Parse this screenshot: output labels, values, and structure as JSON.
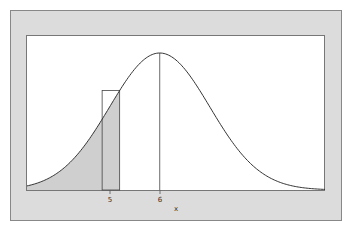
{
  "chart_data": {
    "type": "line",
    "title": "",
    "xlabel": "x",
    "ylabel": "",
    "distribution": "normal",
    "mean": 6,
    "sd": 1,
    "x_ticks": [
      {
        "value": 5,
        "label": "5"
      },
      {
        "value": 6,
        "label": "6"
      }
    ],
    "xlim": [
      3.35,
      9.3
    ],
    "shaded_region": {
      "from": 3.35,
      "to": 5.2,
      "description": "area under curve left of 5.2"
    },
    "rectangle": {
      "x_from": 4.85,
      "x_to": 5.2,
      "height_at": 5.2
    },
    "mean_line": {
      "x": 6
    },
    "grid": false,
    "legend": null
  },
  "colors": {
    "frame_bg": "#dcdcdc",
    "plot_bg": "#ffffff",
    "curve": "#333333",
    "shade": "#cfcfcf",
    "border": "#777777"
  },
  "labels": {
    "tick_5": "5",
    "tick_6": "6",
    "x_axis": "x"
  }
}
